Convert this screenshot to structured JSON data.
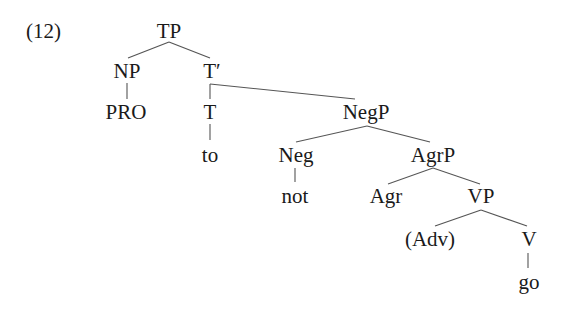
{
  "example": {
    "number": "(12)"
  },
  "tree": {
    "nodes": {
      "TP": "TP",
      "NP": "NP",
      "T_bar": "T′",
      "PRO": "PRO",
      "T": "T",
      "NegP": "NegP",
      "to": "to",
      "Neg": "Neg",
      "AgrP": "AgrP",
      "not": "not",
      "Agr": "Agr",
      "VP": "VP",
      "Adv": "(Adv)",
      "V": "V",
      "go": "go"
    },
    "structure": {
      "label": "TP",
      "children": [
        {
          "label": "NP",
          "children": [
            {
              "label": "PRO"
            }
          ]
        },
        {
          "label": "T′",
          "children": [
            {
              "label": "T",
              "children": [
                {
                  "label": "to"
                }
              ]
            },
            {
              "label": "NegP",
              "children": [
                {
                  "label": "Neg",
                  "children": [
                    {
                      "label": "not"
                    }
                  ]
                },
                {
                  "label": "AgrP",
                  "children": [
                    {
                      "label": "Agr"
                    },
                    {
                      "label": "VP",
                      "children": [
                        {
                          "label": "(Adv)"
                        },
                        {
                          "label": "V",
                          "children": [
                            {
                              "label": "go"
                            }
                          ]
                        }
                      ]
                    }
                  ]
                }
              ]
            }
          ]
        }
      ]
    }
  },
  "colors": {
    "text": "#1a1a1a",
    "edge": "#555555",
    "background": "#ffffff"
  }
}
